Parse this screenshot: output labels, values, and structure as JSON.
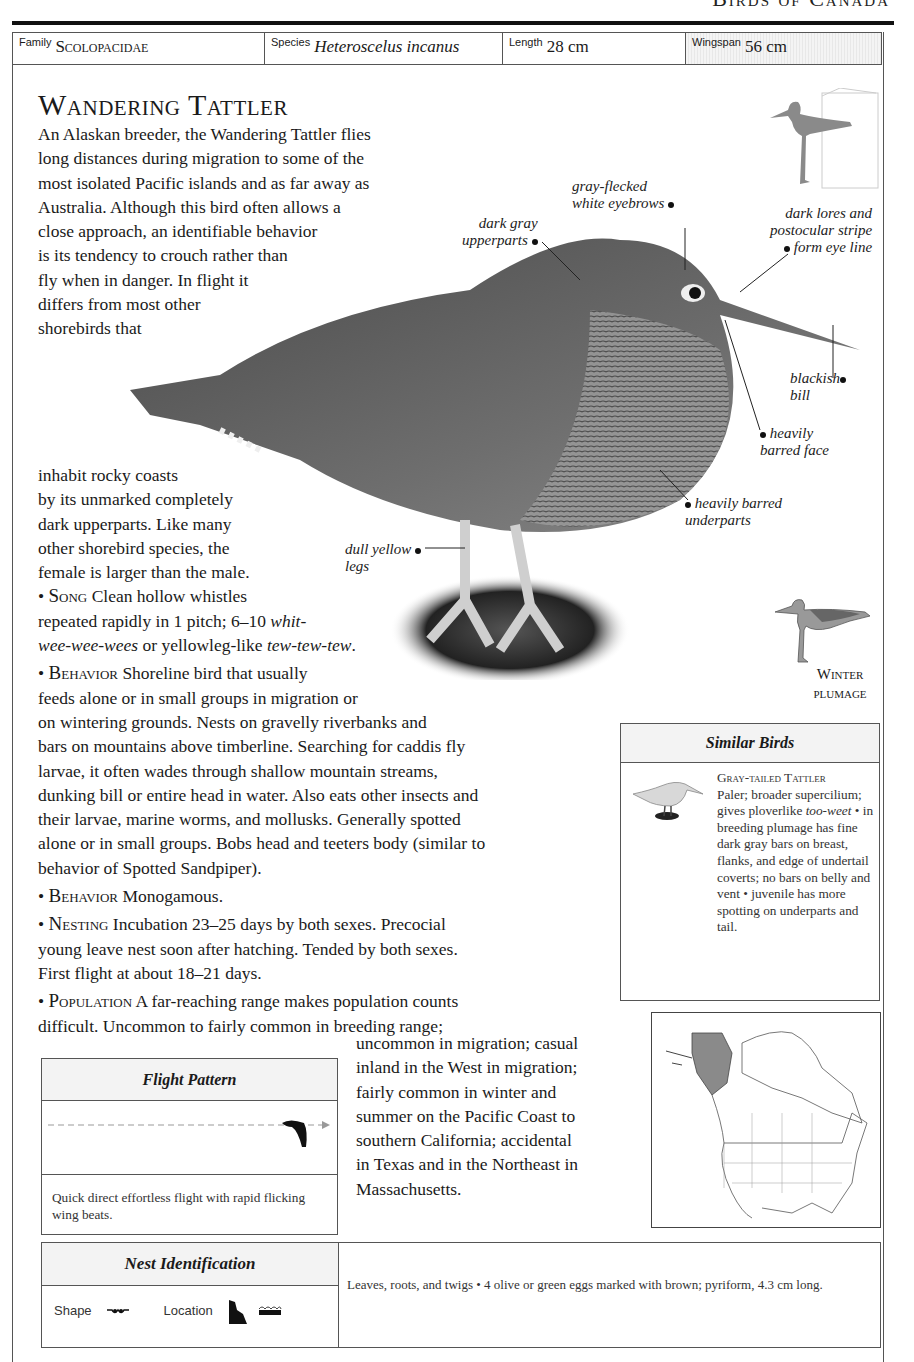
{
  "running_head": "Birds of Canada",
  "info_bar": {
    "family_label": "Family",
    "family_value": "Scolopacidae",
    "species_label": "Species",
    "species_value": "Heteroscelus incanus",
    "length_label": "Length",
    "length_value": "28 cm",
    "wingspan_label": "Wingspan",
    "wingspan_value": "56 cm"
  },
  "title": "Wandering Tattler",
  "intro_lines": [
    "An Alaskan breeder, the Wandering Tattler flies",
    "long distances during migration to some of the",
    "most isolated Pacific islands and as far away as",
    "Australia. Although this bird often allows a",
    "close approach, an identifiable behavior",
    "is its tendency to crouch rather than",
    "fly when in danger. In flight it",
    "differs from most other",
    "shorebirds that"
  ],
  "cont_lines": [
    "inhabit rocky coasts",
    "by its unmarked completely",
    "dark upperparts. Like many",
    "other shorebird species, the",
    "female is larger than the male."
  ],
  "song": {
    "head": "Song",
    "l1": "Clean hollow whistles",
    "l2a": "repeated rapidly in 1 pitch; 6–10 ",
    "l2b": "whit-",
    "l3a": "wee-wee-wees",
    "l3b": " or yellowleg-like ",
    "l3c": "tew-tew-tew",
    "l3d": "."
  },
  "behavior1": {
    "head": "Behavior",
    "lines": [
      "Shoreline bird that usually",
      "feeds alone or in small groups in migration or",
      "on wintering grounds. Nests on gravelly riverbanks and",
      "bars on mountains above timberline. Searching for caddis fly",
      "larvae, it often wades through shallow mountain streams,",
      "dunking bill or entire head in water. Also eats other insects and",
      "their larvae, marine worms, and mollusks. Generally spotted",
      "alone or in small groups. Bobs head and teeters body (similar to",
      "behavior of Spotted Sandpiper)."
    ]
  },
  "behavior2": {
    "head": "Behavior",
    "text": "Monogamous."
  },
  "nesting": {
    "head": "Nesting",
    "lines": [
      "Incubation 23–25 days by both sexes. Precocial",
      "young leave nest soon after hatching. Tended by both sexes.",
      "First flight at about 18–21 days."
    ]
  },
  "population": {
    "head": "Population",
    "lines": [
      "A far-reaching range makes population counts",
      "difficult. Uncommon to fairly common in breeding range;"
    ],
    "cont_lines": [
      "uncommon in migration; casual",
      "inland in the West in migration;",
      "fairly common in winter and",
      "summer on the Pacific Coast to",
      "southern California; accidental",
      "in Texas and in the Northeast in",
      "Massachusetts."
    ]
  },
  "callouts": {
    "eyebrows": [
      "gray-flecked",
      "white eyebrows"
    ],
    "upperparts": [
      "dark gray",
      "upperparts"
    ],
    "lores": [
      "dark lores and",
      "postocular stripe",
      "form eye line"
    ],
    "bill": [
      "blackish",
      "bill"
    ],
    "face": [
      "heavily",
      "barred face"
    ],
    "underparts": [
      "heavily barred",
      "underparts"
    ],
    "legs": [
      "dull yellow",
      "legs"
    ]
  },
  "winter_plumage": [
    "Winter",
    "plumage"
  ],
  "similar_birds": {
    "title": "Similar Birds",
    "name": "Gray-tailed Tattler",
    "desc_a": "Paler; broader supercilium; gives ploverlike ",
    "desc_b": "too-weet",
    "desc_c": " • in breeding plumage has fine dark gray bars on breast, flanks, and edge of undertail coverts; no bars on belly and vent • juvenile has more spotting on underparts and tail."
  },
  "flight_pattern": {
    "title": "Flight Pattern",
    "description": "Quick direct effortless flight with rapid flicking wing beats."
  },
  "nest_identification": {
    "title": "Nest Identification",
    "shape_label": "Shape",
    "location_label": "Location",
    "description": "Leaves, roots, and twigs • 4 olive or green eggs marked with brown; pyriform, 4.3 cm long."
  },
  "colors": {
    "rule": "#111111",
    "border": "#555555",
    "header_bg": "#f3f3f3",
    "range_fill": "#8a8a8a"
  }
}
